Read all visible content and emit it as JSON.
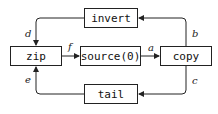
{
  "nodes": {
    "invert": "invert",
    "zip": "zip",
    "source": "source(0)",
    "copy": "copy",
    "tail": "tail"
  },
  "edges": {
    "a": "a",
    "b": "b",
    "c": "c",
    "d": "d",
    "e": "e",
    "f": "f"
  },
  "colors": {
    "stroke": "#222222",
    "background": "#ffffff"
  }
}
